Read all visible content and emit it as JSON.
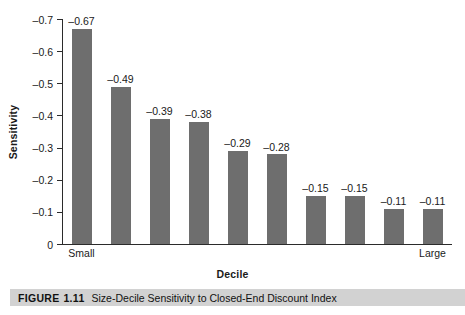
{
  "chart_data": {
    "type": "bar",
    "title": "Size-Decile Sensitivity to Closed-End Discount Index",
    "xlabel": "Decile",
    "ylabel": "Sensitivity",
    "categories": [
      "1",
      "2",
      "3",
      "4",
      "5",
      "6",
      "7",
      "8",
      "9",
      "10"
    ],
    "category_edge_labels": {
      "first": "Small",
      "last": "Large"
    },
    "values": [
      -0.67,
      -0.49,
      -0.39,
      -0.38,
      -0.29,
      -0.28,
      -0.15,
      -0.15,
      -0.11,
      -0.11
    ],
    "value_labels": [
      "–0.67",
      "–0.49",
      "–0.39",
      "–0.38",
      "–0.29",
      "–0.28",
      "–0.15",
      "–0.15",
      "–0.11",
      "–0.11"
    ],
    "ylim": [
      -0.7,
      0
    ],
    "y_ticks": [
      -0.7,
      -0.6,
      -0.5,
      -0.4,
      -0.3,
      -0.2,
      -0.1,
      0
    ],
    "y_tick_labels": [
      "–0.7",
      "–0.6",
      "–0.5",
      "–0.4",
      "–0.3",
      "–0.2",
      "–0.1",
      "0"
    ],
    "y_axis_inverted": true,
    "grid": false,
    "legend": "none",
    "bar_color": "#6e6e6e",
    "axis_color": "#2b2b2b"
  },
  "caption": {
    "figure_label": "FIGURE",
    "figure_number": "1.11",
    "text": "Size-Decile Sensitivity to Closed-End Discount Index",
    "band_color": "#d2d2d2"
  }
}
